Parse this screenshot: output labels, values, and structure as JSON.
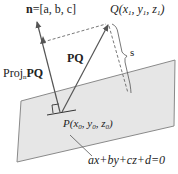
{
  "diagram": {
    "type": "point-to-plane distance",
    "labels": {
      "normal_bold": "n",
      "normal_rest": "=[a, b, c]",
      "q_point": "Q(x",
      "q_sub1": "1",
      "q_mid1": ", y",
      "q_sub2": "1",
      "q_mid2": ", z",
      "q_sub3": "1",
      "q_end": ")",
      "pq": "PQ",
      "proj_prefix": "Proj",
      "proj_sub": "n",
      "proj_vec": "PQ",
      "distance": "s",
      "p_point": "P(x",
      "p_sub1": "0",
      "p_mid1": ", y",
      "p_sub2": "0",
      "p_mid2": ", z",
      "p_sub3": "0",
      "p_end": ")",
      "plane_equation": "ax+by+cz+d=0"
    },
    "colors": {
      "plane_fill": "#e6e6e6",
      "plane_stroke": "#8a8a8a",
      "lines": "#555555",
      "text": "#222222"
    }
  }
}
